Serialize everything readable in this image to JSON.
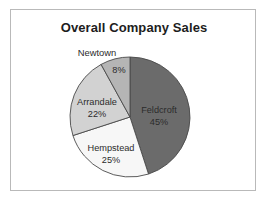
{
  "chart": {
    "title": "Overall Company Sales"
  },
  "chart_data": {
    "type": "pie",
    "title": "Overall Company Sales",
    "xlabel": "",
    "ylabel": "",
    "legend": "none",
    "grid": false,
    "start_angle_deg": 0,
    "direction": "clockwise",
    "categories": [
      "Feldcroft",
      "Hempstead",
      "Arrandale",
      "Newtown"
    ],
    "values": [
      45,
      25,
      22,
      8
    ],
    "value_unit": "%",
    "slices": [
      {
        "label": "Feldcroft",
        "value": 45,
        "value_text": "45%",
        "color": "#6b6b6b",
        "label_placement": "inside",
        "label_x": 158,
        "label_y": 112,
        "value_x": 158,
        "value_y": 124
      },
      {
        "label": "Hempstead",
        "value": 25,
        "value_text": "25%",
        "color": "#f7f7f7",
        "label_placement": "inside",
        "label_x": 110,
        "label_y": 150,
        "value_x": 110,
        "value_y": 162
      },
      {
        "label": "Arrandale",
        "value": 22,
        "value_text": "22%",
        "color": "#d2d2d2",
        "label_placement": "inside",
        "label_x": 96,
        "label_y": 104,
        "value_x": 96,
        "value_y": 116
      },
      {
        "label": "Newtown",
        "value": 8,
        "value_text": "8%",
        "color": "#b5b5b5",
        "label_placement": "outside-top",
        "label_x": 96,
        "label_y": 55,
        "value_x": 118,
        "value_y": 72
      }
    ],
    "geometry": {
      "center_x": 129,
      "center_y": 116,
      "radius": 60
    },
    "colors": {
      "outline": "#4a4a4a",
      "frame_border": "#b9b9b9",
      "background": "#ffffff",
      "text": "#2b2b2b",
      "title_text": "#1d1d1d"
    }
  }
}
